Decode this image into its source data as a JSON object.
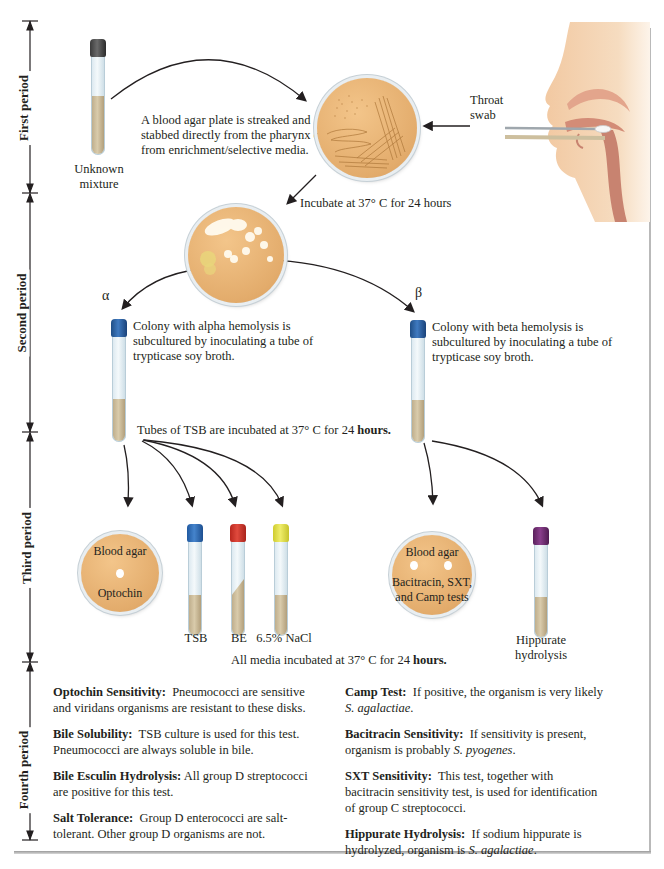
{
  "periods": [
    {
      "label": "First period"
    },
    {
      "label": "Second period"
    },
    {
      "label": "Third period"
    },
    {
      "label": "Fourth period"
    }
  ],
  "first_period": {
    "unknown_tube_label_line1": "Unknown",
    "unknown_tube_label_line2": "mixture",
    "streak_text_line1": "A blood agar plate is streaked and",
    "streak_text_line2": "stabbed directly from the pharynx or",
    "streak_text_line3": "from enrichment/selective media.",
    "swab_label_line1": "Throat",
    "swab_label_line2": "swab",
    "incubate_text": "Incubate at 37° C for 24 hours"
  },
  "second_period": {
    "alpha_symbol": "α",
    "beta_symbol": "β",
    "alpha_text_line1": "Colony with alpha hemolysis is",
    "alpha_text_line2": "subcultured by inoculating a tube of",
    "alpha_text_line3": "trypticase soy broth.",
    "beta_text_line1": "Colony with beta hemolysis is",
    "beta_text_line2": "subcultured by inoculating a tube of",
    "beta_text_line3": "trypticase soy broth.",
    "tsb_incubate_text": "Tubes of TSB are incubated at 37° C for 24 ",
    "tsb_incubate_bold": "hours."
  },
  "third_period": {
    "alpha_plate_top": "Blood agar",
    "alpha_plate_bottom": "Optochin",
    "tubes": [
      {
        "label": "TSB",
        "cap_color": "#2f6fb5"
      },
      {
        "label": "BE",
        "cap_color": "#d2372c"
      },
      {
        "label": "6.5% NaCl",
        "cap_color": "#e3e14a"
      }
    ],
    "beta_plate_top": "Blood agar",
    "beta_plate_line2": "Bacitracin, SXT,",
    "beta_plate_line3": "and Camp tests",
    "hippurate_cap_color": "#6b2a6e",
    "hippurate_label_line1": "Hippurate",
    "hippurate_label_line2": "hydrolysis",
    "all_media_text": "All media incubated at 37° C for 24 ",
    "all_media_bold": "hours."
  },
  "fourth_period": {
    "left": [
      {
        "title": "Optochin Sensitivity:",
        "body": "Pneumococci are sensitive and viridans organisms are resistant to these disks."
      },
      {
        "title": "Bile Solubility:",
        "body": "TSB culture is used for this test. Pneumococci are always soluble in bile."
      },
      {
        "title": "Bile Esculin Hydrolysis:",
        "body": "All group D streptococci are positive for this test."
      },
      {
        "title": "Salt Tolerance:",
        "body": "Group D enterococci are salt-tolerant. Other group D organisms are not."
      }
    ],
    "right": [
      {
        "title": "Camp Test:",
        "body": "If positive, the organism is very likely ",
        "italic": "S. agalactiae",
        "tail": "."
      },
      {
        "title": "Bacitracin Sensitivity:",
        "body": "If sensitivity is present, organism is probably ",
        "italic": "S. pyogenes",
        "tail": "."
      },
      {
        "title": "SXT Sensitivity:",
        "body": "This test, together with bacitracin sensitivity test, is used for identification of group C streptococci.",
        "italic": "",
        "tail": ""
      },
      {
        "title": "Hippurate Hydrolysis:",
        "body": "If sodium hippurate is hydrolyzed, organism is ",
        "italic": "S. agalactiae",
        "tail": "."
      }
    ]
  }
}
